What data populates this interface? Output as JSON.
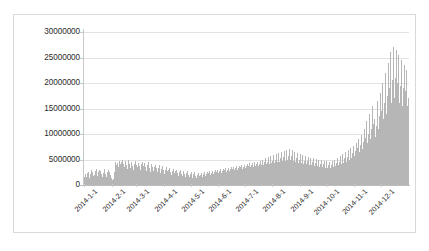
{
  "chart_data": {
    "type": "bar",
    "title": "",
    "xlabel": "",
    "ylabel": "",
    "ylim": [
      0,
      30000000
    ],
    "y_ticks": [
      0,
      5000000,
      10000000,
      15000000,
      20000000,
      25000000,
      30000000
    ],
    "y_tick_labels": [
      "0",
      "5000000",
      "10000000",
      "15000000",
      "20000000",
      "25000000",
      "30000000"
    ],
    "grid": true,
    "legend": null,
    "bar_color": "#b6b6b6",
    "gridline_color": "#e2e2e2",
    "x_tick_labels": [
      "2014-1-1",
      "2014-2-1",
      "2014-3-1",
      "2014-4-1",
      "2014-5-1",
      "2014-6-1",
      "2014-7-1",
      "2014-8-1",
      "2014-9-1",
      "2014-10-1",
      "2014-11-1",
      "2014-12-1"
    ],
    "x_tick_indices": [
      0,
      31,
      59,
      90,
      120,
      151,
      181,
      212,
      243,
      273,
      304,
      334
    ],
    "x_range": [
      "2014-1-1",
      "2014-12-31"
    ],
    "values": [
      1600000,
      2100000,
      1500000,
      2400000,
      2600000,
      1900000,
      1400000,
      2200000,
      2900000,
      2500000,
      1800000,
      2000000,
      2700000,
      3100000,
      2300000,
      1700000,
      2600000,
      3000000,
      2800000,
      2100000,
      1500000,
      2400000,
      3200000,
      2900000,
      2200000,
      1600000,
      2500000,
      3000000,
      2600000,
      2000000,
      1400000,
      900000,
      700000,
      1100000,
      2600000,
      4600000,
      3900000,
      4300000,
      3500000,
      4800000,
      4100000,
      3300000,
      4500000,
      5000000,
      4200000,
      3600000,
      4700000,
      4000000,
      3100000,
      4400000,
      4900000,
      4100000,
      3400000,
      4600000,
      3800000,
      3000000,
      4200000,
      4700000,
      3900000,
      2800000,
      3500000,
      4300000,
      3700000,
      2900000,
      4100000,
      4600000,
      3800000,
      3200000,
      4400000,
      3600000,
      2700000,
      3900000,
      4500000,
      3400000,
      2600000,
      3800000,
      4200000,
      3500000,
      2800000,
      3600000,
      4000000,
      3300000,
      2500000,
      3400000,
      3900000,
      3100000,
      2400000,
      3200000,
      3700000,
      2900000,
      2200000,
      3000000,
      3500000,
      2700000,
      2100000,
      2900000,
      3300000,
      2600000,
      2000000,
      2800000,
      3100000,
      2400000,
      1900000,
      2700000,
      3000000,
      2300000,
      1800000,
      2500000,
      2900000,
      2200000,
      1700000,
      2400000,
      2800000,
      2100000,
      1600000,
      2300000,
      2700000,
      2000000,
      1500000,
      2200000,
      2600000,
      1900000,
      1400000,
      2100000,
      2500000,
      1800000,
      1300000,
      2000000,
      2400000,
      1700000,
      1200000,
      1900000,
      2300000,
      1600000,
      2100000,
      2500000,
      1800000,
      2200000,
      2600000,
      1900000,
      2300000,
      2700000,
      2000000,
      2400000,
      2800000,
      2100000,
      2500000,
      2900000,
      2200000,
      2600000,
      3000000,
      2300000,
      2700000,
      3100000,
      2400000,
      2800000,
      3200000,
      2500000,
      2900000,
      3300000,
      2600000,
      3000000,
      3400000,
      2700000,
      3100000,
      3500000,
      2800000,
      3200000,
      3600000,
      2900000,
      3300000,
      3700000,
      3000000,
      3400000,
      3800000,
      3100000,
      3500000,
      3900000,
      3200000,
      3600000,
      4000000,
      3300000,
      3700000,
      4100000,
      3400000,
      3800000,
      4300000,
      3500000,
      3900000,
      4400000,
      3600000,
      4000000,
      4500000,
      3700000,
      4100000,
      4600000,
      3800000,
      4200000,
      4800000,
      3900000,
      4400000,
      5000000,
      4000000,
      4500000,
      5200000,
      4100000,
      4600000,
      5400000,
      4200000,
      4700000,
      5600000,
      4300000,
      4800000,
      5800000,
      4400000,
      5000000,
      6000000,
      4500000,
      5200000,
      6200000,
      4600000,
      5300000,
      6400000,
      4700000,
      5400000,
      6600000,
      4800000,
      5500000,
      6800000,
      4900000,
      5600000,
      7000000,
      5000000,
      5700000,
      6900000,
      4800000,
      5400000,
      6500000,
      4600000,
      5200000,
      6300000,
      4400000,
      5000000,
      6100000,
      4300000,
      4900000,
      5900000,
      4200000,
      4800000,
      5700000,
      4100000,
      4700000,
      5500000,
      4000000,
      4600000,
      5300000,
      3900000,
      4500000,
      5200000,
      3800000,
      4400000,
      5100000,
      3700000,
      4300000,
      5000000,
      3600000,
      4200000,
      4900000,
      3500000,
      4100000,
      4800000,
      3400000,
      4000000,
      4700000,
      3300000,
      3900000,
      4600000,
      3400000,
      4000000,
      4800000,
      3500000,
      4200000,
      5000000,
      3700000,
      4400000,
      5300000,
      3900000,
      4600000,
      5600000,
      4100000,
      4900000,
      6000000,
      4300000,
      5200000,
      6400000,
      4600000,
      5500000,
      6800000,
      4900000,
      5900000,
      7200000,
      5200000,
      6300000,
      7600000,
      5600000,
      6700000,
      8200000,
      6000000,
      7200000,
      9000000,
      6500000,
      7800000,
      9800000,
      7000000,
      8400000,
      11000000,
      7600000,
      9200000,
      12500000,
      8300000,
      10000000,
      14000000,
      9000000,
      11000000,
      15500000,
      10000000,
      12000000,
      13000000,
      9500000,
      11500000,
      16500000,
      11000000,
      13500000,
      18000000,
      12000000,
      14500000,
      20000000,
      13000000,
      16000000,
      22000000,
      14000000,
      17500000,
      24000000,
      15000000,
      19000000,
      26000000,
      16000000,
      20500000,
      27000000,
      17000000,
      21000000,
      26500000,
      16500000,
      20000000,
      25500000,
      16000000,
      19500000,
      24500000,
      15500000,
      19000000,
      23500000,
      15000000,
      18500000,
      22500000,
      15500000,
      17000000
    ]
  }
}
